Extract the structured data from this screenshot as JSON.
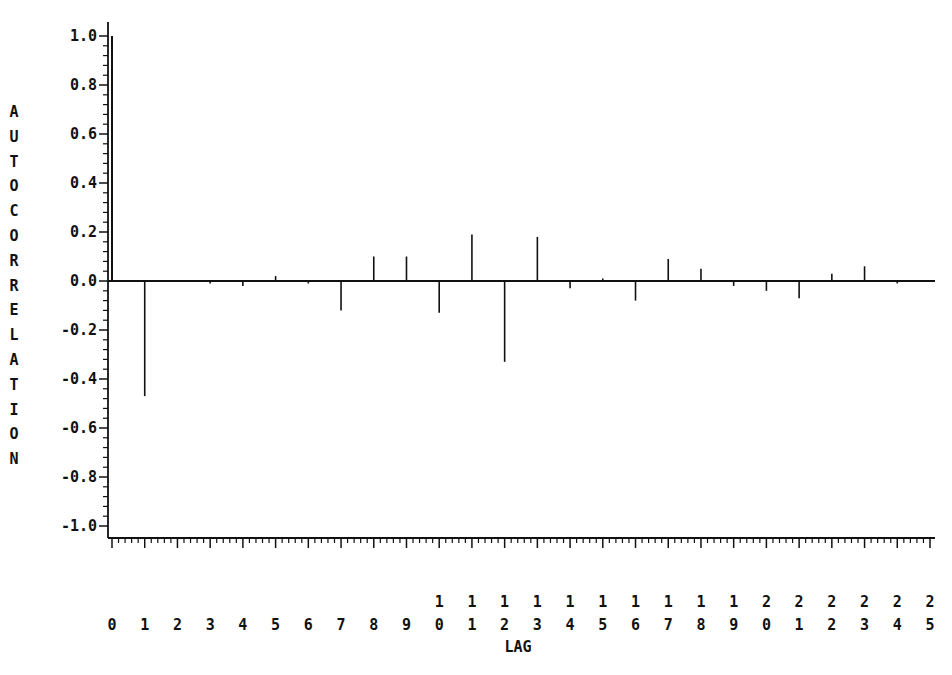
{
  "chart_data": {
    "type": "bar",
    "subtype": "autocorrelation-stem",
    "title": "",
    "xlabel": "LAG",
    "ylabel": "AUTOCORRELATION",
    "x": [
      0,
      1,
      2,
      3,
      4,
      5,
      6,
      7,
      8,
      9,
      10,
      11,
      12,
      13,
      14,
      15,
      16,
      17,
      18,
      19,
      20,
      21,
      22,
      23,
      24,
      25
    ],
    "categories": [
      "0",
      "1",
      "2",
      "3",
      "4",
      "5",
      "6",
      "7",
      "8",
      "9",
      "10",
      "11",
      "12",
      "13",
      "14",
      "15",
      "16",
      "17",
      "18",
      "19",
      "20",
      "21",
      "22",
      "23",
      "24",
      "25"
    ],
    "values": [
      1.0,
      -0.47,
      0.0,
      -0.01,
      -0.02,
      0.02,
      -0.01,
      -0.12,
      0.1,
      0.1,
      -0.13,
      0.19,
      -0.33,
      0.18,
      -0.03,
      0.01,
      -0.08,
      0.09,
      0.05,
      -0.02,
      -0.04,
      -0.07,
      0.03,
      0.06,
      -0.01,
      0.0
    ],
    "ylim": [
      -1.0,
      1.0
    ],
    "xlim": [
      0,
      25
    ],
    "y_ticks": [
      "1.0",
      "0.8",
      "0.6",
      "0.4",
      "0.2",
      "0.0",
      "-0.2",
      "-0.4",
      "-0.6",
      "-0.8",
      "-1.0"
    ],
    "y_tick_values": [
      1.0,
      0.8,
      0.6,
      0.4,
      0.2,
      0.0,
      -0.2,
      -0.4,
      -0.6,
      -0.8,
      -1.0
    ],
    "y_minor_per_major": 4,
    "x_minor_per_major": 4,
    "x_tick_label_style": "stacked-digits",
    "grid": false,
    "legend": null,
    "colors": {
      "line": "#111111",
      "background": "#ffffff"
    }
  },
  "axes": {
    "y_label_letters": [
      "A",
      "U",
      "T",
      "O",
      "C",
      "O",
      "R",
      "R",
      "E",
      "L",
      "A",
      "T",
      "I",
      "O",
      "N"
    ],
    "x_label": "LAG"
  },
  "caption": {
    "text": "FIGURE ... (truncated at bottom edge)"
  }
}
